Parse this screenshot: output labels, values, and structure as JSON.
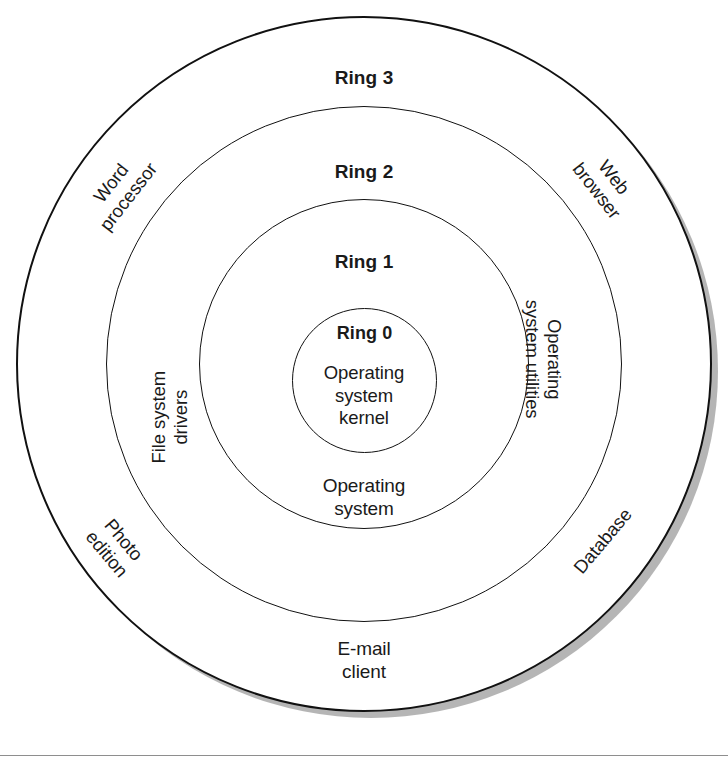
{
  "diagram": {
    "type": "concentric-rings",
    "center": {
      "x": 364,
      "y": 364
    },
    "colors": {
      "stroke": "#111111",
      "text": "#1a1a1a",
      "background": "#ffffff",
      "shadow": "#787878"
    },
    "rings": [
      {
        "id": "ring3",
        "name": "Ring 3",
        "radius": 348,
        "body": "E-mail\nclient"
      },
      {
        "id": "ring2",
        "name": "Ring 2",
        "radius": 258,
        "body": ""
      },
      {
        "id": "ring1",
        "name": "Ring 1",
        "radius": 165,
        "body": "Operating\nsystem"
      },
      {
        "id": "ring0",
        "name": "Ring 0",
        "radius": 72,
        "body": "Operating\nsystem\nkernel"
      }
    ],
    "outer_labels": [
      {
        "id": "word-processor",
        "text": "Word\nprocessor",
        "rotation": -52
      },
      {
        "id": "file-system-drivers",
        "text": "File system\ndrivers",
        "rotation": -90
      },
      {
        "id": "photo-edition",
        "text": "Photo\nedition",
        "rotation": 50
      },
      {
        "id": "web-browser",
        "text": "Web\nbrowser",
        "rotation": 52
      },
      {
        "id": "os-utilities",
        "text": "Operating\nsystem utilities",
        "rotation": 90
      },
      {
        "id": "database",
        "text": "Database",
        "rotation": -50
      }
    ]
  }
}
